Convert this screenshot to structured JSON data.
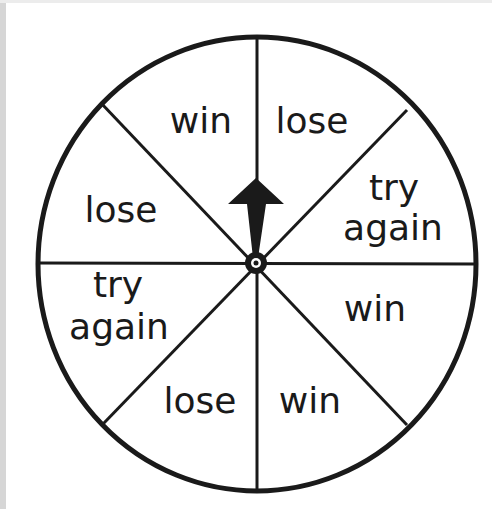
{
  "spinner": {
    "title": "Spinner wheel",
    "sections": 8,
    "pointer_direction": "up",
    "colors": {
      "stroke": "#1a1a1a",
      "fill": "#ffffff"
    },
    "labels": {
      "top_left": "win",
      "top_right": "lose",
      "right_upper_1": "try",
      "right_upper_2": "again",
      "right_lower": "win",
      "bottom_right": "win",
      "bottom_left": "lose",
      "left_lower_1": "try",
      "left_lower_2": "again",
      "left_upper": "lose"
    }
  }
}
